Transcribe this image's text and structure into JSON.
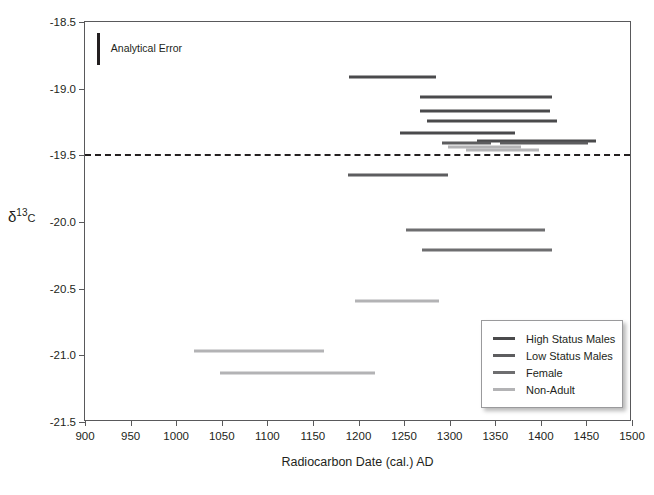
{
  "chart_data": {
    "type": "bar",
    "orientation": "horizontal-range",
    "title": "",
    "xlabel": "Radiocarbon Date (cal.) AD",
    "ylabel": "δ13C",
    "ylabel_parts": {
      "delta": "δ",
      "superscript": "13",
      "element": "C"
    },
    "xlim": [
      900,
      1500
    ],
    "ylim": [
      -21.5,
      -18.5
    ],
    "xticks": [
      900,
      950,
      1000,
      1050,
      1100,
      1150,
      1200,
      1250,
      1300,
      1350,
      1400,
      1450,
      1500
    ],
    "yticks": [
      -18.5,
      -19.0,
      -19.5,
      -20.0,
      -20.5,
      -21.0,
      -21.5
    ],
    "ytick_labels": [
      "-18.5",
      "-19.0",
      "-19.5",
      "-20.0",
      "-20.5",
      "-21.0",
      "-21.5"
    ],
    "grid": false,
    "legend_position": "lower-right",
    "reference_line": {
      "axis": "y",
      "value": -19.5,
      "style": "dashed",
      "color": "#231f20"
    },
    "annotations": [
      {
        "name": "analytical-error",
        "label": "Analytical Error",
        "x_start": 913,
        "y_top": -18.58,
        "y_bottom": -18.82,
        "color": "#231f20"
      }
    ],
    "series": [
      {
        "name": "High Status Males",
        "color": "#4a4a4c",
        "ranges": [
          {
            "x_start": 1190,
            "x_end": 1285,
            "y": -18.91
          },
          {
            "x_start": 1268,
            "x_end": 1412,
            "y": -19.06
          },
          {
            "x_start": 1268,
            "x_end": 1410,
            "y": -19.17
          },
          {
            "x_start": 1275,
            "x_end": 1418,
            "y": -19.24
          },
          {
            "x_start": 1245,
            "x_end": 1372,
            "y": -19.33
          },
          {
            "x_start": 1330,
            "x_end": 1460,
            "y": -19.39
          }
        ]
      },
      {
        "name": "Low Status Males",
        "color": "#5d5d5f",
        "ranges": [
          {
            "x_start": 1292,
            "x_end": 1345,
            "y": -19.41
          },
          {
            "x_start": 1355,
            "x_end": 1452,
            "y": -19.41
          },
          {
            "x_start": 1188,
            "x_end": 1298,
            "y": -19.65
          }
        ]
      },
      {
        "name": "Female",
        "color": "#6e6e70",
        "ranges": [
          {
            "x_start": 1252,
            "x_end": 1405,
            "y": -20.06
          },
          {
            "x_start": 1270,
            "x_end": 1412,
            "y": -20.21
          }
        ]
      },
      {
        "name": "Non-Adult",
        "color": "#b3b3b5",
        "ranges": [
          {
            "x_start": 1298,
            "x_end": 1378,
            "y": -19.44
          },
          {
            "x_start": 1318,
            "x_end": 1398,
            "y": -19.46
          },
          {
            "x_start": 1196,
            "x_end": 1288,
            "y": -20.59
          },
          {
            "x_start": 1020,
            "x_end": 1162,
            "y": -20.97
          },
          {
            "x_start": 1048,
            "x_end": 1218,
            "y": -21.13
          }
        ]
      }
    ],
    "legend": [
      {
        "label": "High Status Males",
        "color": "#4a4a4c"
      },
      {
        "label": "Low Status Males",
        "color": "#5d5d5f"
      },
      {
        "label": "Female",
        "color": "#6e6e70"
      },
      {
        "label": "Non-Adult",
        "color": "#b3b3b5"
      }
    ]
  }
}
